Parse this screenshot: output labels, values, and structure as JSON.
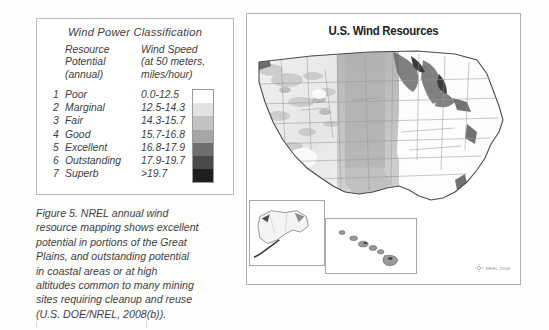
{
  "figure": {
    "caption_lines": [
      "Figure 5.  NREL annual wind",
      "resource mapping shows excellent",
      "potential in portions of the Great",
      "Plains, and outstanding potential",
      "in coastal areas or at high",
      "altitudes common to many mining",
      "sites requiring cleanup and reuse",
      "(U.S. DOE/NREL, 2008(b))."
    ]
  },
  "legend": {
    "title": "Wind Power Classification",
    "header_left": "Resource\nPotential\n(annual)",
    "header_right": "Wind Speed\n(at 50 meters,\nmiles/hour)",
    "rows": [
      {
        "num": "1",
        "label": "Poor",
        "speed": "0.0-12.5",
        "swatch": "#ffffff"
      },
      {
        "num": "2",
        "label": "Marginal",
        "speed": "12.5-14.3",
        "swatch": "#e2e2e2"
      },
      {
        "num": "3",
        "label": "Fair",
        "speed": "14.3-15.7",
        "swatch": "#c2c2c2"
      },
      {
        "num": "4",
        "label": "Good",
        "speed": "15.7-16.8",
        "swatch": "#a6a6a6"
      },
      {
        "num": "5",
        "label": "Excellent",
        "speed": "16.8-17.9",
        "swatch": "#6f6f6f"
      },
      {
        "num": "6",
        "label": "Outstanding",
        "speed": "17.9-19.7",
        "swatch": "#4a4a4a"
      },
      {
        "num": "7",
        "label": "Superb",
        "speed": ">19.7",
        "swatch": "#1e1e1e"
      }
    ]
  },
  "map": {
    "title": "U.S. Wind Resources",
    "credit": "NREL 2008",
    "insets": [
      {
        "name": "alaska"
      },
      {
        "name": "hawaii"
      }
    ]
  },
  "colors": {
    "panel_border": "#b0b0b0",
    "legend_border": "#b9b9b9",
    "text": "#3d3d3d",
    "map_outline": "#5a5a5a",
    "state_line": "#9b9b9b"
  }
}
